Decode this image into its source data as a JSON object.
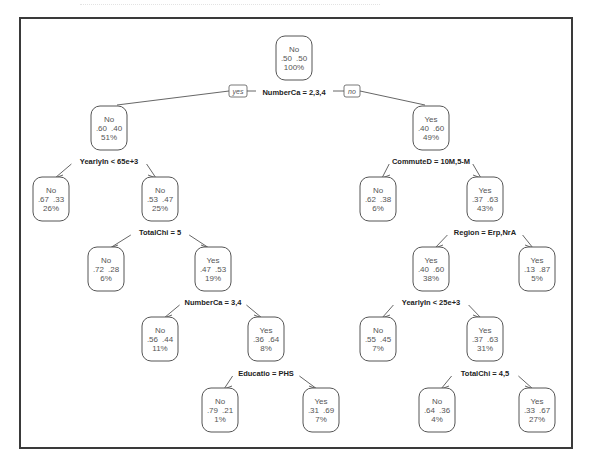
{
  "figure": {
    "type": "decision-tree",
    "root_split_tags": {
      "left": "yes",
      "right": "no"
    }
  },
  "nodes": [
    {
      "id": "n1",
      "x": 294,
      "y": 58,
      "label": "No",
      "probs": ".50  .50",
      "pct": "100%"
    },
    {
      "id": "n2",
      "x": 109,
      "y": 128,
      "label": "No",
      "probs": ".60  .40",
      "pct": "51%"
    },
    {
      "id": "n3",
      "x": 431,
      "y": 128,
      "label": "Yes",
      "probs": ".40  .60",
      "pct": "49%"
    },
    {
      "id": "n4",
      "x": 51,
      "y": 199,
      "label": "No",
      "probs": ".67  .33",
      "pct": "26%"
    },
    {
      "id": "n5",
      "x": 160,
      "y": 199,
      "label": "No",
      "probs": ".53  .47",
      "pct": "25%"
    },
    {
      "id": "n6",
      "x": 378,
      "y": 199,
      "label": "No",
      "probs": ".62  .38",
      "pct": "6%"
    },
    {
      "id": "n7",
      "x": 485,
      "y": 199,
      "label": "Yes",
      "probs": ".37  .63",
      "pct": "43%"
    },
    {
      "id": "n8",
      "x": 106,
      "y": 269,
      "label": "No",
      "probs": ".72  .28",
      "pct": "6%"
    },
    {
      "id": "n9",
      "x": 213,
      "y": 269,
      "label": "Yes",
      "probs": ".47  .53",
      "pct": "19%"
    },
    {
      "id": "n10",
      "x": 431,
      "y": 269,
      "label": "Yes",
      "probs": ".40  .60",
      "pct": "38%"
    },
    {
      "id": "n11",
      "x": 537,
      "y": 269,
      "label": "Yes",
      "probs": ".13  .87",
      "pct": "5%"
    },
    {
      "id": "n12",
      "x": 160,
      "y": 339,
      "label": "No",
      "probs": ".56  .44",
      "pct": "11%"
    },
    {
      "id": "n13",
      "x": 266,
      "y": 339,
      "label": "Yes",
      "probs": ".36  .64",
      "pct": "8%"
    },
    {
      "id": "n14",
      "x": 378,
      "y": 339,
      "label": "No",
      "probs": ".55  .45",
      "pct": "7%"
    },
    {
      "id": "n15",
      "x": 485,
      "y": 339,
      "label": "Yes",
      "probs": ".37  .63",
      "pct": "31%"
    },
    {
      "id": "n16",
      "x": 220,
      "y": 410,
      "label": "No",
      "probs": ".79  .21",
      "pct": "1%"
    },
    {
      "id": "n17",
      "x": 321,
      "y": 410,
      "label": "Yes",
      "probs": ".31  .69",
      "pct": "7%"
    },
    {
      "id": "n18",
      "x": 437,
      "y": 410,
      "label": "No",
      "probs": ".64  .36",
      "pct": "4%"
    },
    {
      "id": "n19",
      "x": 537,
      "y": 410,
      "label": "Yes",
      "probs": ".33  .67",
      "pct": "27%"
    }
  ],
  "splits": [
    {
      "parent": "n1",
      "left": "n2",
      "right": "n3",
      "label": "NumberCa = 2,3,4",
      "x": 294,
      "y": 92
    },
    {
      "parent": "n2",
      "left": "n4",
      "right": "n5",
      "label": "YearlyIn < 65e+3",
      "x": 109,
      "y": 161
    },
    {
      "parent": "n3",
      "left": "n6",
      "right": "n7",
      "label": "CommuteD = 10M,5-M",
      "x": 431,
      "y": 161
    },
    {
      "parent": "n5",
      "left": "n8",
      "right": "n9",
      "label": "TotalChi = 5",
      "x": 160,
      "y": 232
    },
    {
      "parent": "n7",
      "left": "n10",
      "right": "n11",
      "label": "Region = Erp,NrA",
      "x": 485,
      "y": 232
    },
    {
      "parent": "n9",
      "left": "n12",
      "right": "n13",
      "label": "NumberCa = 3,4",
      "x": 213,
      "y": 302
    },
    {
      "parent": "n10",
      "left": "n14",
      "right": "n15",
      "label": "YearlyIn < 25e+3",
      "x": 431,
      "y": 302
    },
    {
      "parent": "n13",
      "left": "n16",
      "right": "n17",
      "label": "Educatio = PHS",
      "x": 266,
      "y": 373
    },
    {
      "parent": "n15",
      "left": "n18",
      "right": "n19",
      "label": "TotalChi = 4,5",
      "x": 485,
      "y": 373
    }
  ],
  "colors": {
    "frame": "#3a3a3a",
    "line": "#555555",
    "split_text": "#222222",
    "node_text": "#555555"
  }
}
